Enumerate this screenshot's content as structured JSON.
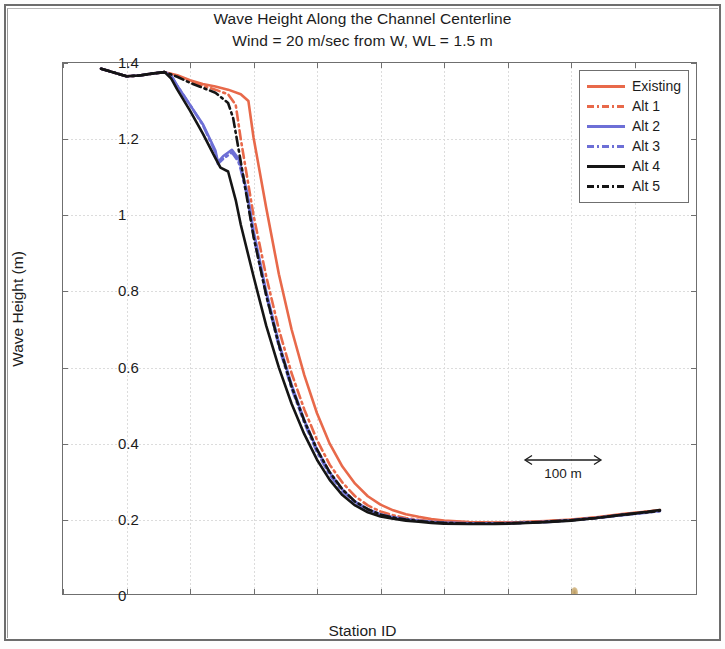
{
  "figure": {
    "title_line1": "Wave Height Along the Channel Centerline",
    "title_line2": "Wind = 20 m/sec from W, WL = 1.5 m"
  },
  "annotation": {
    "scale_label": "100 m"
  },
  "legend": {
    "items": [
      {
        "label": "Existing",
        "color": "#e8694a",
        "style": "solid"
      },
      {
        "label": "Alt 1",
        "color": "#e8694a",
        "style": "dashdot"
      },
      {
        "label": "Alt 2",
        "color": "#6d6fd6",
        "style": "solid"
      },
      {
        "label": "Alt 3",
        "color": "#6d6fd6",
        "style": "dashdot"
      },
      {
        "label": "Alt 4",
        "color": "#151515",
        "style": "solid"
      },
      {
        "label": "Alt 5",
        "color": "#151515",
        "style": "dashdot"
      }
    ]
  },
  "chart_data": {
    "type": "line",
    "title": "Wave Height Along the Channel Centerline\nWind = 20 m/sec from W, WL = 1.5 m",
    "xlabel": "Station ID",
    "ylabel": "Wave Height (m)",
    "xlim": [
      25,
      75
    ],
    "ylim": [
      0,
      1.4
    ],
    "xticks": [
      25,
      30,
      35,
      40,
      45,
      50,
      55,
      60,
      65,
      70,
      75
    ],
    "xticklabels": [
      "25",
      "30",
      "35",
      "40",
      "45",
      "50",
      "55",
      "60",
      "65",
      "70",
      "75"
    ],
    "yticks": [
      0,
      0.2,
      0.4,
      0.6,
      0.8,
      1.0,
      1.2,
      1.4
    ],
    "yticklabels": [
      "0",
      "0.2",
      "0.4",
      "0.6",
      "0.8",
      "1",
      "1.2",
      "1.4"
    ],
    "grid": true,
    "legend_position": "upper right",
    "annotations": [
      {
        "text": "100 m",
        "x": 61.5,
        "y": 0.27,
        "type": "double-arrow-scale"
      }
    ],
    "series": [
      {
        "name": "Existing",
        "color": "#e8694a",
        "style": "solid",
        "x": [
          28.0,
          29.0,
          30.0,
          31.0,
          32.0,
          33.0,
          34.0,
          35.0,
          36.0,
          37.0,
          38.0,
          39.0,
          39.6,
          40.0,
          41.0,
          42.0,
          43.0,
          44.0,
          45.0,
          46.0,
          47.0,
          48.0,
          49.0,
          50.0,
          51.0,
          52.0,
          53.0,
          54.0,
          55.0,
          57.0,
          59.0,
          61.0,
          63.0,
          65.0,
          67.0,
          69.0,
          71.0,
          72.0
        ],
        "y": [
          1.385,
          1.375,
          1.365,
          1.367,
          1.372,
          1.376,
          1.368,
          1.355,
          1.345,
          1.338,
          1.33,
          1.318,
          1.3,
          1.205,
          1.02,
          0.845,
          0.7,
          0.58,
          0.48,
          0.4,
          0.34,
          0.295,
          0.262,
          0.24,
          0.225,
          0.215,
          0.208,
          0.202,
          0.198,
          0.194,
          0.193,
          0.194,
          0.197,
          0.201,
          0.207,
          0.215,
          0.222,
          0.226
        ]
      },
      {
        "name": "Alt 1",
        "color": "#e8694a",
        "style": "dashdot",
        "x": [
          28.0,
          29.0,
          30.0,
          31.0,
          32.0,
          33.0,
          34.0,
          35.0,
          36.0,
          37.0,
          38.0,
          38.6,
          39.0,
          40.0,
          41.0,
          42.0,
          43.0,
          44.0,
          45.0,
          46.0,
          47.0,
          48.0,
          49.0,
          50.0,
          51.0,
          52.0,
          53.0,
          54.0,
          55.0,
          57.0,
          59.0,
          61.0,
          63.0,
          65.0,
          67.0,
          69.0,
          71.0,
          72.0
        ],
        "y": [
          1.385,
          1.375,
          1.365,
          1.367,
          1.372,
          1.376,
          1.366,
          1.352,
          1.34,
          1.33,
          1.318,
          1.29,
          1.2,
          1.0,
          0.84,
          0.7,
          0.585,
          0.49,
          0.41,
          0.345,
          0.298,
          0.262,
          0.238,
          0.222,
          0.212,
          0.205,
          0.2,
          0.196,
          0.194,
          0.192,
          0.192,
          0.193,
          0.196,
          0.2,
          0.206,
          0.214,
          0.221,
          0.225
        ]
      },
      {
        "name": "Alt 2",
        "color": "#6d6fd6",
        "style": "solid",
        "x": [
          28.0,
          29.0,
          30.0,
          31.0,
          32.0,
          33.0,
          33.5,
          34.0,
          35.0,
          36.0,
          37.0,
          37.2,
          37.6,
          38.3,
          38.8,
          39.0,
          39.5,
          40.0,
          41.0,
          42.0,
          43.0,
          44.0,
          45.0,
          46.0,
          47.0,
          48.0,
          49.0,
          50.0,
          51.0,
          52.0,
          53.0,
          54.0,
          55.0,
          57.0,
          59.0,
          61.0,
          63.0,
          65.0,
          67.0,
          69.0,
          71.0,
          72.0
        ],
        "y": [
          1.385,
          1.375,
          1.365,
          1.367,
          1.372,
          1.376,
          1.368,
          1.34,
          1.29,
          1.24,
          1.17,
          1.14,
          1.155,
          1.172,
          1.15,
          1.13,
          1.06,
          0.96,
          0.8,
          0.665,
          0.555,
          0.462,
          0.385,
          0.325,
          0.28,
          0.248,
          0.228,
          0.215,
          0.207,
          0.202,
          0.198,
          0.195,
          0.193,
          0.191,
          0.191,
          0.192,
          0.195,
          0.199,
          0.205,
          0.213,
          0.22,
          0.224
        ]
      },
      {
        "name": "Alt 3",
        "color": "#6d6fd6",
        "style": "dashdot",
        "x": [
          28.0,
          29.0,
          30.0,
          31.0,
          32.0,
          33.0,
          33.5,
          34.0,
          35.0,
          36.0,
          37.0,
          37.2,
          37.6,
          38.3,
          38.8,
          39.0,
          39.5,
          40.0,
          41.0,
          42.0,
          43.0,
          44.0,
          45.0,
          46.0,
          47.0,
          48.0,
          49.0,
          50.0,
          51.0,
          52.0,
          53.0,
          54.0,
          55.0,
          57.0,
          59.0,
          61.0,
          63.0,
          65.0,
          67.0,
          69.0,
          71.0,
          72.0
        ],
        "y": [
          1.385,
          1.375,
          1.365,
          1.367,
          1.372,
          1.376,
          1.368,
          1.34,
          1.29,
          1.238,
          1.165,
          1.135,
          1.148,
          1.165,
          1.142,
          1.12,
          1.05,
          0.945,
          0.79,
          0.655,
          0.545,
          0.455,
          0.378,
          0.318,
          0.275,
          0.245,
          0.226,
          0.213,
          0.206,
          0.201,
          0.197,
          0.194,
          0.192,
          0.19,
          0.19,
          0.192,
          0.194,
          0.199,
          0.205,
          0.212,
          0.219,
          0.223
        ]
      },
      {
        "name": "Alt 4",
        "color": "#151515",
        "style": "solid",
        "x": [
          28.0,
          29.0,
          30.0,
          31.0,
          32.0,
          33.0,
          33.5,
          34.0,
          35.0,
          36.0,
          37.0,
          37.4,
          38.0,
          38.6,
          39.0,
          40.0,
          41.0,
          42.0,
          43.0,
          44.0,
          45.0,
          46.0,
          47.0,
          48.0,
          49.0,
          50.0,
          51.0,
          52.0,
          53.0,
          54.0,
          55.0,
          57.0,
          59.0,
          61.0,
          63.0,
          65.0,
          67.0,
          69.0,
          71.0,
          72.0
        ],
        "y": [
          1.385,
          1.375,
          1.365,
          1.367,
          1.372,
          1.376,
          1.36,
          1.33,
          1.275,
          1.215,
          1.15,
          1.125,
          1.115,
          1.04,
          0.975,
          0.84,
          0.71,
          0.6,
          0.505,
          0.425,
          0.358,
          0.305,
          0.265,
          0.238,
          0.22,
          0.209,
          0.203,
          0.198,
          0.195,
          0.192,
          0.19,
          0.189,
          0.189,
          0.191,
          0.194,
          0.198,
          0.205,
          0.213,
          0.221,
          0.226
        ]
      },
      {
        "name": "Alt 5",
        "color": "#151515",
        "style": "dashdot",
        "x": [
          28.0,
          29.0,
          30.0,
          31.0,
          32.0,
          33.0,
          34.0,
          35.0,
          36.0,
          37.0,
          38.0,
          38.4,
          39.0,
          40.0,
          41.0,
          42.0,
          43.0,
          44.0,
          45.0,
          46.0,
          47.0,
          48.0,
          49.0,
          50.0,
          51.0,
          52.0,
          53.0,
          54.0,
          55.0,
          57.0,
          59.0,
          61.0,
          63.0,
          65.0,
          67.0,
          69.0,
          71.0,
          72.0
        ],
        "y": [
          1.385,
          1.375,
          1.365,
          1.367,
          1.372,
          1.376,
          1.364,
          1.348,
          1.335,
          1.322,
          1.295,
          1.255,
          1.14,
          0.945,
          0.79,
          0.66,
          0.55,
          0.46,
          0.385,
          0.325,
          0.28,
          0.248,
          0.228,
          0.214,
          0.206,
          0.201,
          0.197,
          0.194,
          0.192,
          0.19,
          0.19,
          0.192,
          0.195,
          0.199,
          0.205,
          0.213,
          0.22,
          0.224
        ]
      }
    ]
  }
}
